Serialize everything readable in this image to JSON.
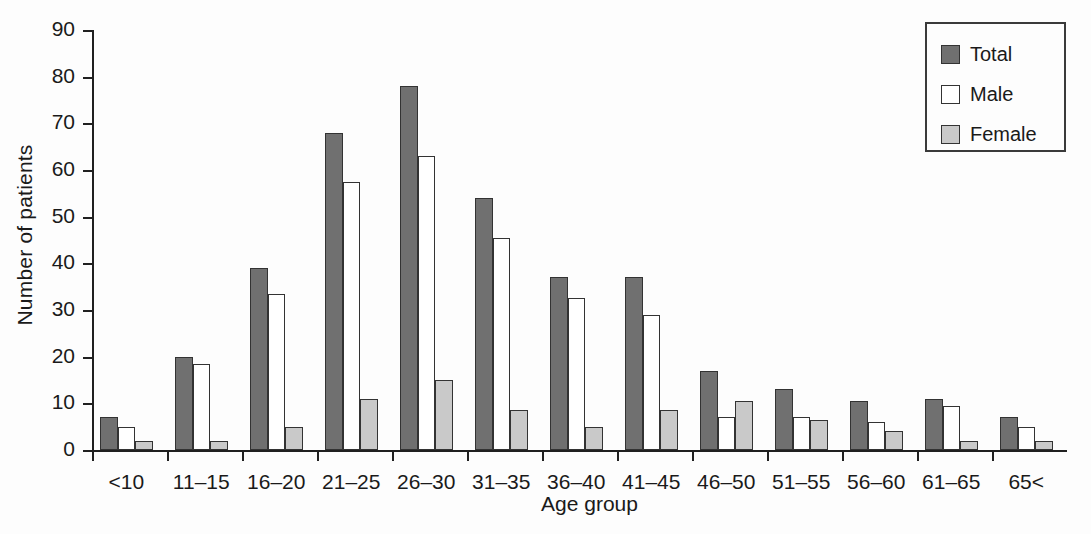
{
  "chart_data": {
    "type": "bar",
    "title": "",
    "xlabel": "Age group",
    "ylabel": "Number of patients",
    "ylim": [
      0,
      90
    ],
    "ytick_step": 10,
    "yticks": [
      90,
      80,
      70,
      60,
      50,
      40,
      30,
      20,
      10,
      0
    ],
    "grid": false,
    "legend_position": "top-right",
    "categories": [
      "<10",
      "11–15",
      "16–20",
      "21–25",
      "26–30",
      "31–35",
      "36–40",
      "41–45",
      "46–50",
      "51–55",
      "56–60",
      "61–65",
      "65<"
    ],
    "series": [
      {
        "name": "Total",
        "color": "#707070",
        "values": [
          7,
          20,
          39,
          68,
          78,
          54,
          37,
          37,
          17,
          13,
          10.5,
          11,
          7
        ]
      },
      {
        "name": "Male",
        "color": "#ffffff",
        "values": [
          5,
          18.5,
          33.5,
          57.5,
          63,
          45.5,
          32.5,
          29,
          7,
          7,
          6,
          9.5,
          5
        ]
      },
      {
        "name": "Female",
        "color": "#c9c9c9",
        "values": [
          2,
          2,
          5,
          11,
          15,
          8.5,
          5,
          8.5,
          10.5,
          6.5,
          4,
          2,
          2
        ]
      }
    ]
  },
  "legend": {
    "items": [
      {
        "label": "Total",
        "swatch": "total"
      },
      {
        "label": "Male",
        "swatch": "male"
      },
      {
        "label": "Female",
        "swatch": "female"
      }
    ]
  }
}
